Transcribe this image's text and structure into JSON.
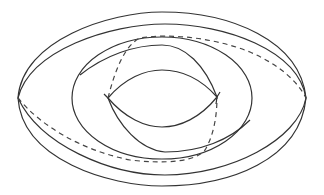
{
  "diagram": {
    "type": "torus-with-curves",
    "colors": {
      "stroke": "#333333",
      "dashed": "#444444",
      "background": "#ffffff"
    },
    "elements": [
      {
        "name": "outer-boundary-upper",
        "style": "solid"
      },
      {
        "name": "outer-boundary-lower",
        "style": "solid"
      },
      {
        "name": "inner-rim-upper",
        "style": "solid"
      },
      {
        "name": "inner-rim-lower",
        "style": "solid"
      },
      {
        "name": "middle-loop",
        "style": "solid"
      },
      {
        "name": "hole-lens-upper",
        "style": "solid"
      },
      {
        "name": "hole-lens-lower",
        "style": "solid"
      },
      {
        "name": "meridian-upper-hidden",
        "style": "dashed"
      },
      {
        "name": "meridian-lower-hidden",
        "style": "dashed"
      }
    ]
  }
}
